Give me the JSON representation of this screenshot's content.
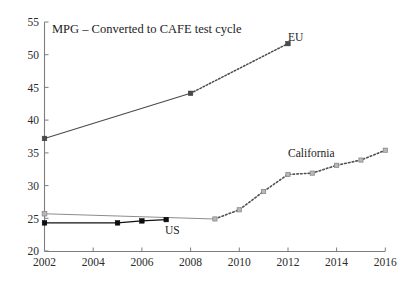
{
  "chart_data": {
    "type": "line",
    "title": "MPG – Converted to CAFE test cycle",
    "xlabel": "",
    "ylabel": "",
    "xlim": [
      2002,
      2016
    ],
    "ylim": [
      20,
      55
    ],
    "grid": false,
    "legend_position": "inline-annotations",
    "x_ticks": [
      "2002",
      "2004",
      "2006",
      "2008",
      "2010",
      "2012",
      "2014",
      "2016"
    ],
    "y_ticks": [
      "20",
      "25",
      "30",
      "35",
      "40",
      "45",
      "50",
      "55"
    ],
    "series": [
      {
        "name": "EU",
        "label": "EU",
        "color": "#4a4a4a",
        "marker": "square",
        "style": "solid-then-dotted",
        "points": [
          {
            "x": 2002,
            "y": 37.2
          },
          {
            "x": 2008,
            "y": 44.1
          },
          {
            "x": 2012,
            "y": 51.7
          }
        ],
        "solid_segment": [
          2002,
          2008
        ],
        "dotted_segment": [
          2008,
          2012
        ]
      },
      {
        "name": "US",
        "label": "US",
        "color": "#0d0d0d",
        "marker": "square",
        "style": "solid",
        "points": [
          {
            "x": 2002,
            "y": 24.3
          },
          {
            "x": 2005,
            "y": 24.3
          },
          {
            "x": 2006,
            "y": 24.6
          },
          {
            "x": 2007,
            "y": 24.8
          }
        ]
      },
      {
        "name": "California",
        "label": "California",
        "color": "#8c8c8c",
        "marker": "square",
        "style": "solid-then-dotted",
        "points": [
          {
            "x": 2002,
            "y": 25.7
          },
          {
            "x": 2009,
            "y": 24.9
          },
          {
            "x": 2010,
            "y": 26.3
          },
          {
            "x": 2011,
            "y": 29.1
          },
          {
            "x": 2012,
            "y": 31.7
          },
          {
            "x": 2013,
            "y": 31.9
          },
          {
            "x": 2014,
            "y": 33.1
          },
          {
            "x": 2015,
            "y": 33.9
          },
          {
            "x": 2016,
            "y": 35.4
          }
        ],
        "solid_segment": [
          2002,
          2009
        ],
        "dotted_segment": [
          2009,
          2016
        ]
      }
    ],
    "annotations": [
      {
        "text": "EU",
        "x": 2012.3,
        "y": 51.7
      },
      {
        "text": "US",
        "x": 2007.0,
        "y": 22.6
      },
      {
        "text": "California",
        "x": 2013.0,
        "y": 37.2
      }
    ]
  }
}
